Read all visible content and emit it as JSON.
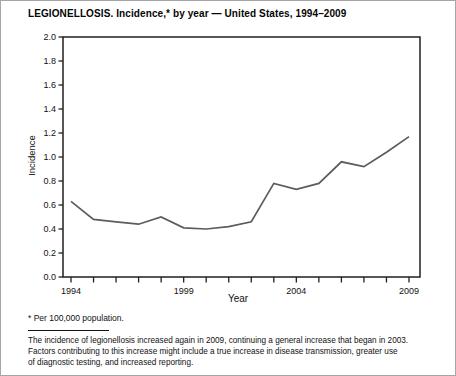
{
  "figure": {
    "title": "LEGIONELLOSIS. Incidence,* by year — United States, 1994–2009",
    "footnote": "* Per 100,000 population.",
    "caption_lines": [
      "The incidence of legionellosis increased again in 2009, continuing a general increase that began in 2003.",
      "Factors contributing to this increase might include a true increase in disease transmission, greater use",
      "of diagnostic testing, and increased reporting."
    ]
  },
  "chart_data": {
    "type": "line",
    "title": "LEGIONELLOSIS. Incidence,* by year — United States, 1994–2009",
    "xlabel": "Year",
    "ylabel": "Incidence",
    "x": [
      1994,
      1995,
      1996,
      1997,
      1998,
      1999,
      2000,
      2001,
      2002,
      2003,
      2004,
      2005,
      2006,
      2007,
      2008,
      2009
    ],
    "values": [
      0.63,
      0.48,
      0.46,
      0.44,
      0.5,
      0.41,
      0.4,
      0.42,
      0.46,
      0.78,
      0.73,
      0.78,
      0.96,
      0.92,
      1.04,
      1.17
    ],
    "ylim": [
      0.0,
      2.0
    ],
    "ytick_step": 0.2,
    "xtick_labels": [
      "1994",
      "1999",
      "2004",
      "2009"
    ],
    "grid": false,
    "legend": "none",
    "line_color": "#5c5c5c",
    "axis_color": "#1f1f1f"
  }
}
